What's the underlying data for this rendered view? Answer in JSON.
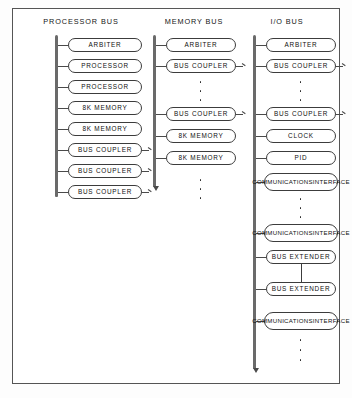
{
  "diagram": {
    "frame": {
      "visible": true,
      "border_color": "#555555"
    },
    "background_color": "#ffffff",
    "line_color": "#4a4a4a",
    "node_border_color": "#3c3c3c",
    "columns": [
      {
        "id": "processor-bus",
        "header": "PROCESSOR BUS",
        "segments": [
          {
            "terminator": "none",
            "nodes": [
              {
                "label": "ARBITER",
                "tail": false
              },
              {
                "label": "PROCESSOR",
                "tail": false
              },
              {
                "label": "PROCESSOR",
                "tail": false
              },
              {
                "label": "8K MEMORY",
                "tail": false
              },
              {
                "label": "8K MEMORY",
                "tail": false
              },
              {
                "label": "BUS COUPLER",
                "tail": true
              },
              {
                "label": "BUS COUPLER",
                "tail": true
              },
              {
                "label": "BUS COUPLER",
                "tail": true
              }
            ]
          }
        ]
      },
      {
        "id": "memory-bus",
        "header": "MEMORY BUS",
        "segments": [
          {
            "terminator": "arrow",
            "nodes": [
              {
                "label": "ARBITER",
                "tail": false
              },
              {
                "label": "BUS COUPLER",
                "tail": true
              },
              {
                "ellipsis": true,
                "dots": 3
              },
              {
                "label": "BUS COUPLER",
                "tail": true
              },
              {
                "label": "8K MEMORY",
                "tail": false
              },
              {
                "label": "8K MEMORY",
                "tail": false
              }
            ],
            "trailing_ellipsis": {
              "dots": 3
            }
          }
        ]
      },
      {
        "id": "io-bus",
        "header": "I/O BUS",
        "segments": [
          {
            "terminator": "none",
            "nodes": [
              {
                "label": "ARBITER",
                "tail": false
              },
              {
                "label": "BUS COUPLER",
                "tail": true
              },
              {
                "ellipsis": true,
                "dots": 3
              },
              {
                "label": "BUS COUPLER",
                "tail": true
              },
              {
                "label": "CLOCK",
                "tail": false
              },
              {
                "label": "PID",
                "tail": false
              },
              {
                "label": "COMMUNICATIONS INTERFACE",
                "lines": [
                  "COMMUNICATIONS",
                  "INTERFACE"
                ],
                "tail": false
              },
              {
                "ellipsis": true,
                "dots": 3
              },
              {
                "label": "COMMUNICATIONS INTERFACE",
                "lines": [
                  "COMMUNICATIONS",
                  "INTERFACE"
                ],
                "tail": false
              },
              {
                "label": "BUS EXTENDER",
                "tail": false
              }
            ]
          },
          {
            "terminator": "arrow",
            "nodes": [
              {
                "label": "BUS EXTENDER",
                "tail": false
              },
              {
                "label": "COMMUNICATIONS INTERFACE",
                "lines": [
                  "COMMUNICATIONS",
                  "INTERFACE"
                ],
                "tail": false
              }
            ],
            "trailing_ellipsis": {
              "dots": 3
            }
          }
        ]
      }
    ]
  }
}
